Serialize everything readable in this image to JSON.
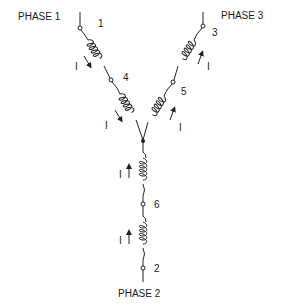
{
  "diagram": {
    "type": "three-phase wye (star) connection",
    "phases": [
      {
        "label": "PHASE 1",
        "terminals": [
          "1",
          "4"
        ],
        "current_label": "I"
      },
      {
        "label": "PHASE 3",
        "terminals": [
          "3",
          "5"
        ],
        "current_label": "I"
      },
      {
        "label": "PHASE 2",
        "terminals": [
          "2",
          "6"
        ],
        "current_label": "I"
      }
    ],
    "labels": {
      "phase1": "PHASE 1",
      "phase2": "PHASE 2",
      "phase3": "PHASE 3",
      "t1": "1",
      "t2": "2",
      "t3": "3",
      "t4": "4",
      "t5": "5",
      "t6": "6",
      "current": "I"
    },
    "colors": {
      "line": "#222222",
      "background": "#ffffff"
    }
  }
}
